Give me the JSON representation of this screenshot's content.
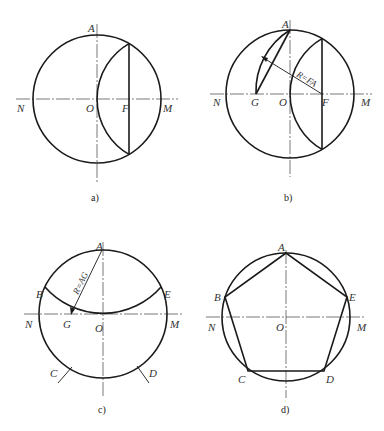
{
  "figure": {
    "panels": [
      {
        "id": "a",
        "caption": "a)",
        "labels": {
          "A": "A",
          "N": "N",
          "O": "O",
          "F": "F",
          "M": "M"
        }
      },
      {
        "id": "b",
        "caption": "b)",
        "labels": {
          "A": "A",
          "N": "N",
          "G": "G",
          "O": "O",
          "F": "F",
          "M": "M"
        },
        "radius_note": "R=FA"
      },
      {
        "id": "c",
        "caption": "c)",
        "labels": {
          "A": "A",
          "B": "B",
          "E": "E",
          "N": "N",
          "G": "G",
          "O": "O",
          "M": "M",
          "C": "C",
          "D": "D"
        },
        "radius_note": "R=AG"
      },
      {
        "id": "d",
        "caption": "d)",
        "labels": {
          "A": "A",
          "B": "B",
          "E": "E",
          "N": "N",
          "O": "O",
          "M": "M",
          "C": "C",
          "D": "D"
        }
      }
    ],
    "colors": {
      "line": "#1a1a1a",
      "axis": "#555555",
      "background": "#ffffff"
    }
  }
}
